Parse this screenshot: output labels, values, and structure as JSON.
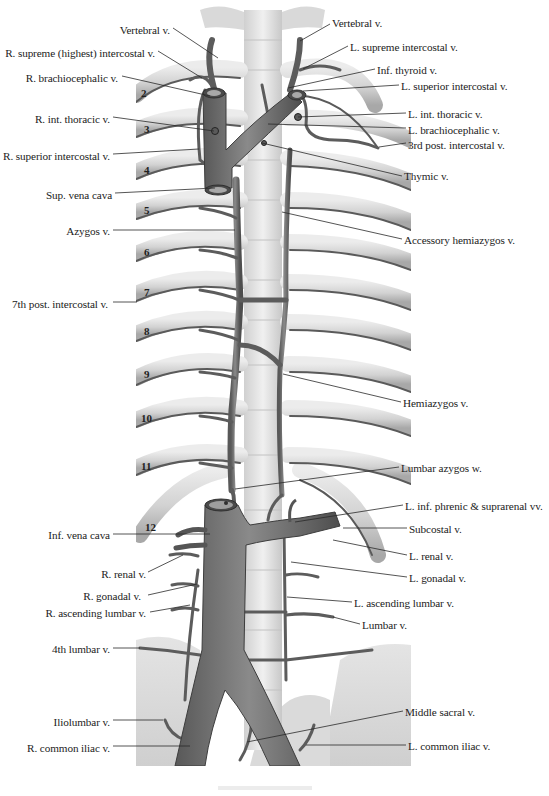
{
  "figure": {
    "labels_left": [
      {
        "id": "r-vertebral",
        "text": "Vertebral v.",
        "x": 170,
        "y": 24,
        "align": "right",
        "lx1": 173,
        "ly1": 28,
        "lx2": 218,
        "ly2": 58
      },
      {
        "id": "r-supreme-intercostal",
        "text": "R. supreme (highest) intercostal v.",
        "x": 155,
        "y": 47,
        "align": "right",
        "lx1": 158,
        "ly1": 51,
        "lx2": 202,
        "ly2": 78
      },
      {
        "id": "r-brachiocephalic",
        "text": "R. brachiocephalic v.",
        "x": 118,
        "y": 72,
        "align": "right",
        "lx1": 122,
        "ly1": 76,
        "lx2": 210,
        "ly2": 96
      },
      {
        "id": "r-int-thoracic",
        "text": "R. int. thoracic v.",
        "x": 110,
        "y": 113,
        "align": "right",
        "lx1": 113,
        "ly1": 117,
        "lx2": 214,
        "ly2": 131
      },
      {
        "id": "r-superior-intercostal",
        "text": "R. superior intercostal v.",
        "x": 110,
        "y": 150,
        "align": "right",
        "lx1": 113,
        "ly1": 154,
        "lx2": 199,
        "ly2": 149
      },
      {
        "id": "sup-vena-cava",
        "text": "Sup. vena cava",
        "x": 112,
        "y": 189,
        "align": "right",
        "lx1": 115,
        "ly1": 193,
        "lx2": 215,
        "ly2": 188
      },
      {
        "id": "azygos",
        "text": "Azygos v.",
        "x": 110,
        "y": 225,
        "align": "right",
        "lx1": 113,
        "ly1": 230,
        "lx2": 235,
        "ly2": 230
      },
      {
        "id": "7th-post-intercostal",
        "text": "7th post. intercostal v.",
        "x": 108,
        "y": 298,
        "align": "right",
        "lx1": 113,
        "ly1": 302,
        "lx2": 137,
        "ly2": 302
      },
      {
        "id": "inf-vena-cava",
        "text": "Inf. vena cava",
        "x": 110,
        "y": 529,
        "align": "right",
        "lx1": 113,
        "ly1": 534,
        "lx2": 210,
        "ly2": 534
      },
      {
        "id": "r-renal",
        "text": "R. renal v.",
        "x": 146,
        "y": 568,
        "align": "right",
        "lx1": 148,
        "ly1": 572,
        "lx2": 183,
        "ly2": 555
      },
      {
        "id": "r-gonadal",
        "text": "R. gonadal v.",
        "x": 141,
        "y": 590,
        "align": "right",
        "lx1": 148,
        "ly1": 595,
        "lx2": 197,
        "ly2": 584
      },
      {
        "id": "r-ascending-lumbar",
        "text": "R. ascending lumbar v.",
        "x": 146,
        "y": 607,
        "align": "right",
        "lx1": 150,
        "ly1": 612,
        "lx2": 190,
        "ly2": 605
      },
      {
        "id": "4th-lumbar",
        "text": "4th lumbar v.",
        "x": 110,
        "y": 643,
        "align": "right",
        "lx1": 113,
        "ly1": 648,
        "lx2": 140,
        "ly2": 648
      },
      {
        "id": "iliolumbar",
        "text": "Iliolumbar v.",
        "x": 110,
        "y": 716,
        "align": "right",
        "lx1": 113,
        "ly1": 720,
        "lx2": 163,
        "ly2": 720
      },
      {
        "id": "r-common-iliac",
        "text": "R. common iliac v.",
        "x": 110,
        "y": 742,
        "align": "right",
        "lx1": 113,
        "ly1": 746,
        "lx2": 190,
        "ly2": 746
      }
    ],
    "labels_right": [
      {
        "id": "l-vertebral",
        "text": "Vertebral v.",
        "x": 332,
        "y": 17,
        "lx1": 330,
        "ly1": 24,
        "lx2": 300,
        "ly2": 41
      },
      {
        "id": "l-supreme-intercostal",
        "text": "L. supreme intercostal v.",
        "x": 350,
        "y": 41,
        "lx1": 348,
        "ly1": 46,
        "lx2": 303,
        "ly2": 69
      },
      {
        "id": "inf-thyroid",
        "text": "Inf. thyroid v.",
        "x": 377,
        "y": 64,
        "lx1": 375,
        "ly1": 69,
        "lx2": 288,
        "ly2": 88
      },
      {
        "id": "l-superior-intercostal",
        "text": "L. superior intercostal v.",
        "x": 401,
        "y": 80,
        "lx1": 399,
        "ly1": 85,
        "lx2": 303,
        "ly2": 91
      },
      {
        "id": "l-int-thoracic",
        "text": "L. int. thoracic v.",
        "x": 408,
        "y": 108,
        "lx1": 406,
        "ly1": 113,
        "lx2": 298,
        "ly2": 117
      },
      {
        "id": "l-brachiocephalic",
        "text": "L. brachiocephalic v.",
        "x": 408,
        "y": 124,
        "lx1": 406,
        "ly1": 128,
        "lx2": 268,
        "ly2": 124
      },
      {
        "id": "3rd-post-intercostal",
        "text": "3rd post. intercostal v.",
        "x": 408,
        "y": 139,
        "lx1": 406,
        "ly1": 143,
        "lx2": 379,
        "ly2": 147
      },
      {
        "id": "thymic",
        "text": "Thymic v.",
        "x": 404,
        "y": 170,
        "lx1": 402,
        "ly1": 176,
        "lx2": 262,
        "ly2": 143
      },
      {
        "id": "accessory-hemiazygos",
        "text": "Accessory hemiazygos v.",
        "x": 404,
        "y": 234,
        "lx1": 402,
        "ly1": 239,
        "lx2": 282,
        "ly2": 212
      },
      {
        "id": "hemiazygos",
        "text": "Hemiazygos v.",
        "x": 403,
        "y": 397,
        "lx1": 401,
        "ly1": 402,
        "lx2": 283,
        "ly2": 374
      },
      {
        "id": "lumbar-azygos",
        "text": "Lumbar azygos w.",
        "x": 401,
        "y": 462,
        "lx1": 399,
        "ly1": 467,
        "lx2": 235,
        "ly2": 489
      },
      {
        "id": "l-inf-phrenic-suprarenal",
        "text": "L. inf. phrenic & suprarenal vv.",
        "x": 405,
        "y": 500,
        "lx1": 403,
        "ly1": 505,
        "lx2": 295,
        "ly2": 522
      },
      {
        "id": "subcostal",
        "text": "Subcostal v.",
        "x": 409,
        "y": 523,
        "lx1": 407,
        "ly1": 528,
        "lx2": 343,
        "ly2": 528
      },
      {
        "id": "l-renal",
        "text": "L. renal v.",
        "x": 409,
        "y": 550,
        "lx1": 407,
        "ly1": 555,
        "lx2": 333,
        "ly2": 540
      },
      {
        "id": "l-gonadal",
        "text": "L. gonadal v.",
        "x": 409,
        "y": 572,
        "lx1": 407,
        "ly1": 577,
        "lx2": 291,
        "ly2": 562
      },
      {
        "id": "l-ascending-lumbar",
        "text": "L. ascending lumbar v.",
        "x": 354,
        "y": 597,
        "lx1": 352,
        "ly1": 602,
        "lx2": 287,
        "ly2": 597
      },
      {
        "id": "lumbar",
        "text": "Lumbar v.",
        "x": 362,
        "y": 619,
        "lx1": 360,
        "ly1": 624,
        "lx2": 333,
        "ly2": 617
      },
      {
        "id": "middle-sacral",
        "text": "Middle sacral v.",
        "x": 405,
        "y": 706,
        "lx1": 403,
        "ly1": 711,
        "lx2": 247,
        "ly2": 742
      },
      {
        "id": "l-common-iliac",
        "text": "L. common iliac v.",
        "x": 408,
        "y": 740,
        "lx1": 406,
        "ly1": 745,
        "lx2": 306,
        "ly2": 745
      }
    ],
    "rib_numbers": [
      {
        "n": "2",
        "x": 141,
        "y": 88
      },
      {
        "n": "3",
        "x": 144,
        "y": 124
      },
      {
        "n": "4",
        "x": 144,
        "y": 165
      },
      {
        "n": "5",
        "x": 144,
        "y": 205
      },
      {
        "n": "6",
        "x": 144,
        "y": 247
      },
      {
        "n": "7",
        "x": 144,
        "y": 287
      },
      {
        "n": "8",
        "x": 144,
        "y": 326
      },
      {
        "n": "9",
        "x": 144,
        "y": 369
      },
      {
        "n": "10",
        "x": 141,
        "y": 413
      },
      {
        "n": "11",
        "x": 141,
        "y": 461
      },
      {
        "n": "12",
        "x": 145,
        "y": 522
      }
    ]
  },
  "colors": {
    "background": "#ffffff",
    "bone": "#d8d8d8",
    "bone_shadow": "#a9a9a9",
    "vein": "#6e6e6e",
    "vein_dark": "#3c3c3c",
    "spine": "#e6e6e6",
    "leader_line": "#2a2a2a",
    "text": "#222222"
  }
}
